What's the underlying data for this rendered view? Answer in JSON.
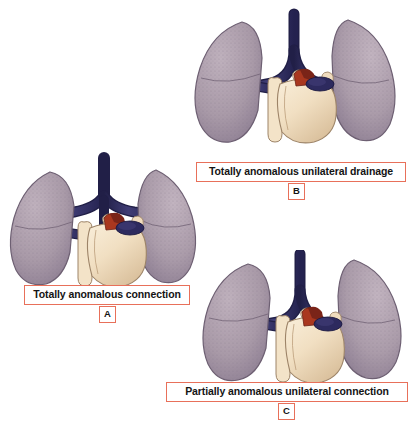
{
  "figure": {
    "background_color": "#ffffff",
    "width": 408,
    "height": 433
  },
  "palette": {
    "lung_fill": "#a99aa8",
    "lung_fill_light": "#b6a8b5",
    "lung_fill_dark": "#96869a",
    "lung_outline": "#6d5f72",
    "vessel_navy": "#2d2a5e",
    "vessel_navy_dark": "#211f47",
    "vessel_navy_light": "#413e78",
    "heart_cream": "#f0dcbe",
    "heart_cream_light": "#f7ead4",
    "heart_cream_dark": "#dcc3a0",
    "heart_outline": "#9d8468",
    "red_patch": "#7a2418",
    "red_patch_light": "#a9371f",
    "caption_border": "#e8705a",
    "caption_text": "#141414",
    "caption_bg": "#ffffff"
  },
  "panels": [
    {
      "id": "A",
      "letter": "A",
      "caption": "Totally anomalous connection",
      "variant": "vertical-confluence",
      "description": "Both lungs drain into a symmetric vertical vein that ascends in the midline"
    },
    {
      "id": "B",
      "letter": "B",
      "caption": "Totally anomalous unilateral drainage",
      "variant": "curved-ascending",
      "description": "Both lungs drain via a curved vessel ascending on the right"
    },
    {
      "id": "C",
      "letter": "C",
      "caption": "Partially anomalous unilateral connection",
      "variant": "curved-ascending-partial",
      "description": "One lung drains anomalously via a curved ascending vessel"
    }
  ]
}
